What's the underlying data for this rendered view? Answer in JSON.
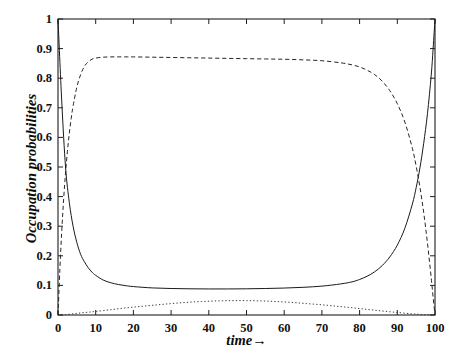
{
  "chart_data": {
    "type": "line",
    "title": "",
    "xlabel": "time→",
    "ylabel": "Occupation probabilities",
    "xlim": [
      0,
      100
    ],
    "ylim": [
      0,
      1
    ],
    "grid": false,
    "legend": "none",
    "xticks": [
      "0",
      "10",
      "20",
      "30",
      "40",
      "50",
      "60",
      "70",
      "80",
      "90",
      "100"
    ],
    "xtick_values": [
      0,
      10,
      20,
      30,
      40,
      50,
      60,
      70,
      80,
      90,
      100
    ],
    "yticks": [
      "0",
      "0.1",
      "0.2",
      "0.3",
      "0.4",
      "0.5",
      "0.6",
      "0.7",
      "0.8",
      "0.9",
      "1"
    ],
    "ytick_values": [
      0,
      0.1,
      0.2,
      0.3,
      0.4,
      0.5,
      0.6,
      0.7,
      0.8,
      0.9,
      1
    ],
    "series": [
      {
        "name": "solid-curve",
        "style": "solid",
        "color": "#1a1a1a",
        "x": [
          0,
          1,
          2,
          3,
          4,
          5,
          6,
          7,
          8,
          9,
          10,
          12,
          14,
          16,
          18,
          20,
          25,
          30,
          35,
          40,
          45,
          50,
          55,
          60,
          65,
          70,
          75,
          78,
          80,
          82,
          84,
          86,
          88,
          90,
          92,
          94,
          95,
          96,
          97,
          98,
          99,
          99.5,
          100
        ],
        "y": [
          1.0,
          0.72,
          0.5,
          0.38,
          0.3,
          0.245,
          0.205,
          0.18,
          0.16,
          0.145,
          0.134,
          0.118,
          0.109,
          0.103,
          0.099,
          0.096,
          0.0915,
          0.0895,
          0.0885,
          0.088,
          0.088,
          0.0885,
          0.0895,
          0.091,
          0.0935,
          0.0975,
          0.105,
          0.112,
          0.12,
          0.131,
          0.146,
          0.167,
          0.196,
          0.236,
          0.293,
          0.375,
          0.43,
          0.497,
          0.58,
          0.68,
          0.81,
          0.9,
          1.0
        ]
      },
      {
        "name": "dashed-curve",
        "style": "dashed",
        "color": "#262626",
        "x": [
          0,
          0.5,
          1,
          1.5,
          2,
          2.5,
          3,
          3.5,
          4,
          5,
          6,
          7,
          8,
          9,
          10,
          12,
          14,
          16,
          18,
          20,
          25,
          30,
          35,
          40,
          45,
          50,
          55,
          60,
          65,
          70,
          75,
          78,
          80,
          82,
          84,
          86,
          88,
          90,
          92,
          94,
          95,
          96,
          97,
          98,
          99,
          99.5,
          100
        ],
        "y": [
          0.0,
          0.155,
          0.285,
          0.392,
          0.48,
          0.553,
          0.614,
          0.664,
          0.706,
          0.77,
          0.812,
          0.84,
          0.855,
          0.864,
          0.868,
          0.871,
          0.872,
          0.872,
          0.872,
          0.872,
          0.871,
          0.87,
          0.869,
          0.868,
          0.867,
          0.866,
          0.865,
          0.864,
          0.862,
          0.859,
          0.852,
          0.845,
          0.838,
          0.827,
          0.812,
          0.79,
          0.758,
          0.714,
          0.652,
          0.563,
          0.503,
          0.432,
          0.346,
          0.243,
          0.125,
          0.06,
          0.0
        ]
      },
      {
        "name": "dotted-curve",
        "style": "dotted",
        "color": "#3a3a3a",
        "x": [
          0,
          2,
          4,
          6,
          8,
          10,
          14,
          18,
          22,
          26,
          30,
          34,
          38,
          42,
          46,
          50,
          54,
          58,
          62,
          66,
          70,
          74,
          78,
          82,
          86,
          90,
          94,
          96,
          98,
          100
        ],
        "y": [
          0.0,
          0.0015,
          0.004,
          0.007,
          0.0095,
          0.012,
          0.018,
          0.024,
          0.029,
          0.034,
          0.0385,
          0.0425,
          0.0455,
          0.0475,
          0.0485,
          0.0485,
          0.0475,
          0.0455,
          0.0425,
          0.0385,
          0.0345,
          0.0295,
          0.0245,
          0.019,
          0.0135,
          0.0085,
          0.0038,
          0.0022,
          0.0008,
          0.0
        ]
      }
    ]
  }
}
